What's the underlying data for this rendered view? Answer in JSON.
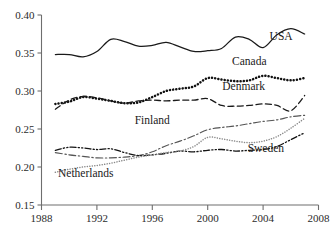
{
  "chart_data": {
    "type": "line",
    "title": "",
    "subtitle": "",
    "xlabel": "",
    "ylabel": "",
    "xlim": [
      1988,
      2008
    ],
    "ylim": [
      0.15,
      0.4
    ],
    "grid": false,
    "legend_position": "inline-right",
    "x_ticks": [
      "1988",
      "1992",
      "1996",
      "2000",
      "2004",
      "2008"
    ],
    "x_tick_values": [
      1988,
      1992,
      1996,
      2000,
      2004,
      2008
    ],
    "y_ticks": [
      "0.15",
      "0.20",
      "0.25",
      "0.30",
      "0.35",
      "0.40"
    ],
    "y_tick_values": [
      0.15,
      0.2,
      0.25,
      0.3,
      0.35,
      0.4
    ],
    "x": [
      1989,
      1990,
      1991,
      1992,
      1993,
      1994,
      1995,
      1996,
      1997,
      1998,
      1999,
      2000,
      2001,
      2002,
      2003,
      2004,
      2005,
      2006,
      2007
    ],
    "series": [
      {
        "name": "USA",
        "style": "solid",
        "color": "#1a1a1a",
        "label": "USA",
        "label_x": 2005.3,
        "label_y": 0.3665,
        "values": [
          0.348,
          0.348,
          0.345,
          0.352,
          0.368,
          0.365,
          0.359,
          0.36,
          0.364,
          0.358,
          0.352,
          0.353,
          0.356,
          0.371,
          0.368,
          0.357,
          0.374,
          0.382,
          0.375
        ]
      },
      {
        "name": "Canada",
        "style": "dotted",
        "color": "#111111",
        "label": "Canada",
        "label_x": 2003.0,
        "label_y": 0.3345,
        "values": [
          0.283,
          0.286,
          0.292,
          0.29,
          0.287,
          0.284,
          0.285,
          0.292,
          0.3,
          0.303,
          0.306,
          0.317,
          0.315,
          0.313,
          0.314,
          0.32,
          0.317,
          0.314,
          0.317
        ]
      },
      {
        "name": "Denmark",
        "style": "dashed",
        "color": "#1a1a1a",
        "label": "Denmark",
        "label_x": 2002.6,
        "label_y": 0.3015,
        "values": [
          0.276,
          0.288,
          0.293,
          0.291,
          0.287,
          0.284,
          0.287,
          0.288,
          0.287,
          0.288,
          0.288,
          0.29,
          0.281,
          0.28,
          0.281,
          0.283,
          0.281,
          0.274,
          0.294
        ]
      },
      {
        "name": "Finland",
        "style": "dashdot",
        "color": "#555555",
        "label": "Finland",
        "label_x": 1996.0,
        "label_y": 0.2565,
        "values": [
          0.219,
          0.216,
          0.214,
          0.212,
          0.212,
          0.213,
          0.215,
          0.22,
          0.228,
          0.234,
          0.241,
          0.249,
          0.252,
          0.254,
          0.257,
          0.26,
          0.262,
          0.266,
          0.268
        ]
      },
      {
        "name": "Sweden",
        "style": "dashdotdot",
        "color": "#141414",
        "label": "Sweden",
        "label_x": 2004.2,
        "label_y": 0.2195,
        "values": [
          0.222,
          0.226,
          0.225,
          0.223,
          0.224,
          0.219,
          0.215,
          0.216,
          0.218,
          0.221,
          0.22,
          0.222,
          0.223,
          0.221,
          0.222,
          0.223,
          0.227,
          0.236,
          0.245
        ]
      },
      {
        "name": "Netherlands",
        "style": "finedotted",
        "color": "#8a8a8a",
        "label": "Netherlands",
        "label_x": 1991.2,
        "label_y": 0.1865,
        "values": [
          0.193,
          0.197,
          0.2,
          0.202,
          0.205,
          0.209,
          0.213,
          0.216,
          0.219,
          0.221,
          0.227,
          0.239,
          0.237,
          0.234,
          0.232,
          0.234,
          0.24,
          0.251,
          0.264
        ]
      }
    ]
  }
}
